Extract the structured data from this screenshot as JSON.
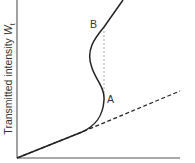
{
  "diagram": {
    "type": "optical bistability curve",
    "y_axis_label": "Transmitted intensity ",
    "y_axis_symbol": "W",
    "y_axis_subscript": "t",
    "points": [
      {
        "id": "A",
        "label": "A"
      },
      {
        "id": "B",
        "label": "B"
      }
    ],
    "colors": {
      "curve": "#222222",
      "axis": "#444444",
      "dashed": "#999999"
    }
  }
}
